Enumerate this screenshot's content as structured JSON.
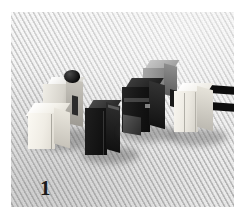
{
  "photo": {
    "caption_number": "1",
    "medium": "black-and-white photograph",
    "background": {
      "name": "woven-cloth-backdrop",
      "base_color": "#dcdcdc",
      "weave_direction": "diagonal lower-left to upper-right"
    },
    "plate": {
      "left": 11,
      "top": 12,
      "width": 223,
      "height": 195,
      "border_color": "#ffffff"
    },
    "objects": [
      {
        "id": "object-1",
        "name": "white-block-with-dark-top-component",
        "order": 1,
        "position": "far left",
        "primary_color": "#f2f1ec",
        "accent_color": "#1a1a1a",
        "description": "light cream cube in front of a pale housing carrying a small dark rounded cap"
      },
      {
        "id": "object-2",
        "name": "black-rectangular-block",
        "order": 2,
        "position": "left-center",
        "primary_color": "#171717",
        "accent_color": "#2c2c2c",
        "description": "upright dark rectangular block standing on the cloth"
      },
      {
        "id": "object-3",
        "name": "dark-block-with-grey-top-cap",
        "order": 3,
        "position": "right-center",
        "primary_color": "#1d1d1d",
        "accent_color": "#8d8d8d",
        "description": "large dark body capped by a lighter grey rectangular block to the rear"
      },
      {
        "id": "object-4",
        "name": "white-block-with-two-black-bars",
        "order": 4,
        "position": "far right",
        "primary_color": "#f4f3ef",
        "accent_color": "#111111",
        "description": "pale block with two horizontal black bars projecting to the right"
      }
    ],
    "layout": {
      "arrangement": "four components in a row receding diagonally from lower-left to upper-right",
      "count": 4
    }
  }
}
